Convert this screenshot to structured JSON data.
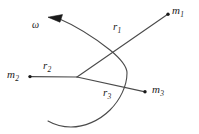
{
  "figure": {
    "kind": "physics-diagram",
    "background_color": "#ffffff",
    "stroke_color": "#4a4a4a",
    "text_color": "#1a1a1a",
    "labels": {
      "mass1": {
        "symbol": "m",
        "subscript": "1"
      },
      "mass2": {
        "symbol": "m",
        "subscript": "2"
      },
      "mass3": {
        "symbol": "m",
        "subscript": "3"
      },
      "radius1": {
        "symbol": "r",
        "subscript": "1"
      },
      "radius2": {
        "symbol": "r",
        "subscript": "2"
      },
      "radius3": {
        "symbol": "r",
        "subscript": "3"
      },
      "angular_velocity": {
        "symbol": "ω"
      }
    },
    "geometry": {
      "pivot": {
        "x": 77,
        "y": 77
      },
      "mass1_point": {
        "x": 168,
        "y": 14
      },
      "mass2_point": {
        "x": 30,
        "y": 77
      },
      "mass3_point": {
        "x": 145,
        "y": 92
      },
      "rotation_arc_radius": 50,
      "rotation_direction": "counterclockwise"
    }
  }
}
